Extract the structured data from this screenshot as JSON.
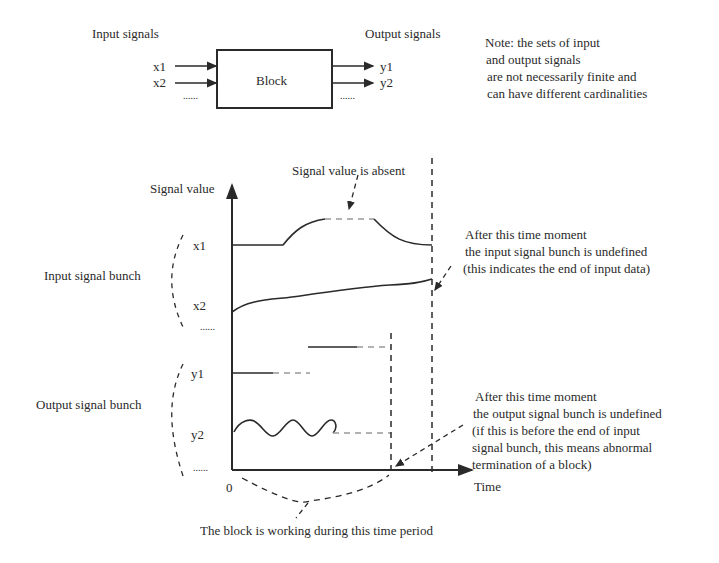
{
  "top_diagram": {
    "input_label": "Input signals",
    "output_label": "Output signals",
    "block_label": "Block",
    "inputs": [
      "x1",
      "x2"
    ],
    "outputs": [
      "y1",
      "y2"
    ],
    "ellipsis": "......",
    "note_lines": [
      "Note: the sets of input",
      "and output signals",
      "are not necessarily finite and",
      "can have different cardinalities"
    ]
  },
  "timing_diagram": {
    "y_axis_label": "Signal value",
    "x_axis_label": "Time",
    "origin_label": "0",
    "absent_annotation": "Signal value is absent",
    "input_bunch_label": "Input signal bunch",
    "output_bunch_label": "Output signal bunch",
    "input_signals": [
      "x1",
      "x2"
    ],
    "output_signals": [
      "y1",
      "y2"
    ],
    "ellipsis": "......",
    "input_end_annotation": [
      "After this time moment",
      "the input signal bunch is undefined",
      "(this indicates the end of input data)"
    ],
    "output_end_annotation": [
      "After this time moment",
      "the output signal bunch is undefined",
      "(if this is before the end of input",
      "signal bunch, this means abnormal",
      "termination of a block)"
    ],
    "working_period_annotation": "The block is working during this time period"
  },
  "colors": {
    "ink": "#2a2a2a",
    "dashed": "#999999",
    "background": "#ffffff"
  }
}
